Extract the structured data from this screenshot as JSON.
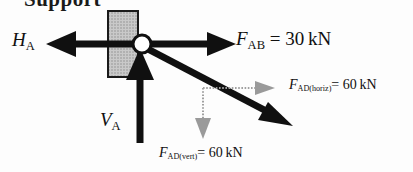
{
  "figure": {
    "kind": "free-body-diagram",
    "title_fragment": "Support",
    "background_color": "#fdfdfd",
    "ink_color": "#101010",
    "hatch_color": "#b4b4b4",
    "component_color": "#8a8a8a"
  },
  "support": {
    "name": "pin-support",
    "fill_label": "hatched",
    "pin_label": "pin-joint"
  },
  "forces": {
    "horizontal_reaction": {
      "symbol": "H",
      "subscript": "A",
      "direction": "left",
      "style": "solid"
    },
    "vertical_reaction": {
      "symbol": "V",
      "subscript": "A",
      "direction": "up",
      "style": "solid"
    },
    "member_ab": {
      "symbol": "F",
      "subscript": "AB",
      "equals": "=",
      "value": "30",
      "unit": "kN",
      "direction": "right",
      "style": "solid"
    },
    "member_ad": {
      "symbol": "F",
      "subscript": "AD",
      "direction": "down-right-diagonal",
      "style": "solid"
    },
    "member_ad_horiz": {
      "symbol": "F",
      "subscript": "AD(horiz)",
      "equals": "=",
      "value": "60",
      "unit": "kN",
      "direction": "right",
      "style": "dotted"
    },
    "member_ad_vert": {
      "symbol": "F",
      "subscript": "AD(vert)",
      "equals": "=",
      "value": "60",
      "unit": "kN",
      "direction": "down",
      "style": "dotted"
    }
  }
}
